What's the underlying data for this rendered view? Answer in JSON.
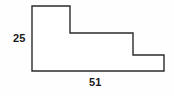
{
  "figure": {
    "kind": "staircase-polygon-diagram",
    "shape_name": "L-shaped staircase polygon",
    "outline_color": "#2b2b2b",
    "fill_color": "#ffffff",
    "background_color": "#fefefe",
    "stroke_width": 1.4,
    "vertices": [
      {
        "x": 32,
        "y": 6
      },
      {
        "x": 70,
        "y": 6
      },
      {
        "x": 70,
        "y": 33
      },
      {
        "x": 133,
        "y": 33
      },
      {
        "x": 133,
        "y": 55
      },
      {
        "x": 164,
        "y": 55
      },
      {
        "x": 164,
        "y": 71
      },
      {
        "x": 32,
        "y": 71
      }
    ],
    "points_attr": "32,6 70,6 70,33 133,33 133,55 164,55 164,71 32,71"
  },
  "labels": {
    "height": "25",
    "width": "51"
  }
}
